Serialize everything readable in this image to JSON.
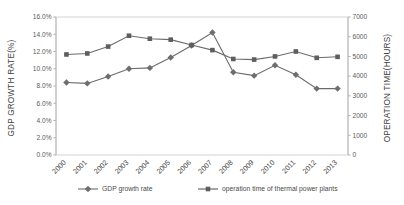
{
  "chart_data": {
    "type": "line",
    "title": "",
    "xlabel": "",
    "categories": [
      "2000",
      "2001",
      "2002",
      "2003",
      "2004",
      "2005",
      "2006",
      "2007",
      "2008",
      "2009",
      "2010",
      "2011",
      "2012",
      "2013"
    ],
    "grid": false,
    "legend_position": "bottom",
    "axes": {
      "left": {
        "label": "GDP GROWTH RATE(%)",
        "min": 0.0,
        "max": 16.0,
        "step": 2.0,
        "ticks": [
          "0.0%",
          "2.0%",
          "4.0%",
          "6.0%",
          "8.0%",
          "10.0%",
          "12.0%",
          "14.0%",
          "16.0%"
        ],
        "tick_values": [
          0.0,
          2.0,
          4.0,
          6.0,
          8.0,
          10.0,
          12.0,
          14.0,
          16.0
        ]
      },
      "right": {
        "label": "OPERATION TIME(HOURS)",
        "min": 0,
        "max": 7000,
        "step": 1000,
        "ticks": [
          "0",
          "1000",
          "2000",
          "3000",
          "4000",
          "5000",
          "6000",
          "7000"
        ],
        "tick_values": [
          0,
          1000,
          2000,
          3000,
          4000,
          5000,
          6000,
          7000
        ]
      }
    },
    "series": [
      {
        "name": "GDP growth rate",
        "axis": "left",
        "marker": "diamond",
        "color": "#6e6e6e",
        "unit": "%",
        "values": [
          8.4,
          8.3,
          9.1,
          10.0,
          10.1,
          11.3,
          12.7,
          14.2,
          9.6,
          9.2,
          10.4,
          9.3,
          7.7,
          7.7
        ]
      },
      {
        "name": "operation time of thermal power plants",
        "axis": "right",
        "marker": "square",
        "color": "#5e5e5e",
        "unit": "hours",
        "values": [
          5100,
          5150,
          5500,
          6050,
          5900,
          5850,
          5580,
          5320,
          4870,
          4840,
          5000,
          5250,
          4930,
          4980
        ]
      }
    ]
  },
  "legend": {
    "items": [
      {
        "label": "GDP growth rate",
        "marker": "diamond"
      },
      {
        "label": "operation time of thermal power plants",
        "marker": "square"
      }
    ]
  },
  "colors": {
    "series_gdp": "#6e6e6e",
    "series_operation": "#5e5e5e",
    "axis": "#9a9a9a",
    "border": "#c8c8c8",
    "text": "#4a4a4a",
    "background": "#ffffff"
  }
}
